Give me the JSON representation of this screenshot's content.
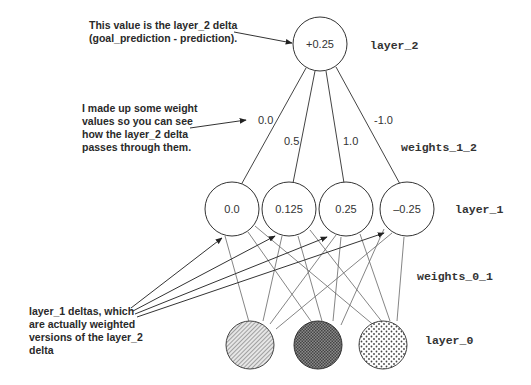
{
  "annotations": {
    "layer2_note": [
      "This value is the layer_2 delta",
      "(goal_prediction - prediction)."
    ],
    "weights_note": [
      "I made up some weight",
      "values so you can see",
      "how the layer_2 delta",
      "passes through them."
    ],
    "layer1_note": [
      "layer_1 deltas, which",
      "are actually weighted",
      "versions of the layer_2",
      "delta"
    ]
  },
  "labels": {
    "layer_2": "layer_2",
    "weights_1_2": "weights_1_2",
    "layer_1": "layer_1",
    "weights_0_1": "weights_0_1",
    "layer_0": "layer_0"
  },
  "layer_2": {
    "nodes": [
      {
        "value": "+0.25"
      }
    ]
  },
  "weights_1_2": {
    "values": [
      "0.0",
      "0.5",
      "1.0",
      "-1.0"
    ]
  },
  "layer_1": {
    "nodes": [
      {
        "value": "0.0"
      },
      {
        "value": "0.125"
      },
      {
        "value": "0.25"
      },
      {
        "value": "–0.25"
      }
    ]
  },
  "layer_0": {
    "nodes": [
      {
        "pattern": "diagonal-hatch"
      },
      {
        "pattern": "crosshatch-dark"
      },
      {
        "pattern": "dots"
      }
    ]
  },
  "colors": {
    "stroke": "#333333",
    "line": "#555555",
    "background": "#ffffff"
  }
}
